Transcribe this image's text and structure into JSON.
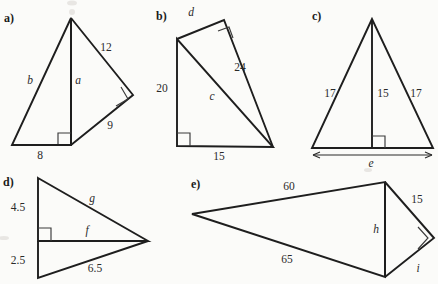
{
  "page": {
    "background_color": "#fbfbf9",
    "ink_color": "#1e1e1e",
    "width": 438,
    "height": 284
  },
  "figures": [
    {
      "id": "a",
      "panel_label": "a)",
      "description": "triangle with altitude and attached right triangle",
      "labels": [
        {
          "name": "side-b",
          "text": "b",
          "style": "italic",
          "x": 30,
          "y": 84
        },
        {
          "name": "altitude-a",
          "text": "a",
          "style": "italic",
          "x": 78,
          "y": 84
        },
        {
          "name": "side-12",
          "text": "12",
          "style": "upright",
          "x": 106,
          "y": 51
        },
        {
          "name": "side-9",
          "text": "9",
          "style": "upright",
          "x": 110,
          "y": 129
        },
        {
          "name": "base-8",
          "text": "8",
          "style": "upright",
          "x": 40,
          "y": 159
        }
      ]
    },
    {
      "id": "b",
      "panel_label": "b)",
      "description": "right triangle with internal cevian forming second right triangle",
      "labels": [
        {
          "name": "side-d",
          "text": "d",
          "style": "italic",
          "x": 191,
          "y": 16
        },
        {
          "name": "side-24",
          "text": "24",
          "style": "upright",
          "x": 240,
          "y": 71
        },
        {
          "name": "side-c",
          "text": "c",
          "style": "italic",
          "x": 212,
          "y": 100
        },
        {
          "name": "side-20",
          "text": "20",
          "style": "upright",
          "x": 162,
          "y": 92
        },
        {
          "name": "base-15",
          "text": "15",
          "style": "upright",
          "x": 219,
          "y": 160
        }
      ]
    },
    {
      "id": "c",
      "panel_label": "c)",
      "description": "isosceles triangle with altitude and base dimension arrow",
      "labels": [
        {
          "name": "left-side-17",
          "text": "17",
          "style": "upright",
          "x": 330,
          "y": 97
        },
        {
          "name": "altitude-15",
          "text": "15",
          "style": "upright",
          "x": 374,
          "y": 97
        },
        {
          "name": "right-side-17",
          "text": "17",
          "style": "upright",
          "x": 414,
          "y": 97
        },
        {
          "name": "base-e",
          "text": "e",
          "style": "italic",
          "x": 371,
          "y": 166
        }
      ]
    },
    {
      "id": "d",
      "panel_label": "d)",
      "description": "two right triangles sharing a common horizontal side",
      "labels": [
        {
          "name": "upper-leg-4-5",
          "text": "4.5",
          "style": "upright",
          "x": 18,
          "y": 211
        },
        {
          "name": "hypotenuse-g",
          "text": "g",
          "style": "italic",
          "x": 92,
          "y": 202
        },
        {
          "name": "shared-side-f",
          "text": "f",
          "style": "italic",
          "x": 87,
          "y": 234
        },
        {
          "name": "lower-leg-2-5",
          "text": "2.5",
          "style": "upright",
          "x": 18,
          "y": 264
        },
        {
          "name": "hypotenuse-6-5",
          "text": "6.5",
          "style": "upright",
          "x": 95,
          "y": 272
        }
      ]
    },
    {
      "id": "e",
      "panel_label": "e)",
      "description": "wide triangle with shared vertical side and attached right triangle",
      "labels": [
        {
          "name": "upper-side-60",
          "text": "60",
          "style": "upright",
          "x": 289,
          "y": 190
        },
        {
          "name": "lower-side-65",
          "text": "65",
          "style": "upright",
          "x": 287,
          "y": 262
        },
        {
          "name": "shared-side-h",
          "text": "h",
          "style": "italic",
          "x": 375,
          "y": 233
        },
        {
          "name": "side-15",
          "text": "15",
          "style": "upright",
          "x": 416,
          "y": 203
        },
        {
          "name": "side-i",
          "text": "i",
          "style": "italic",
          "x": 417,
          "y": 271
        }
      ]
    }
  ]
}
